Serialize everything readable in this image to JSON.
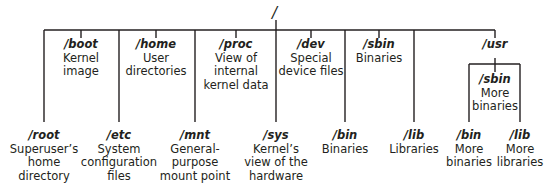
{
  "diagram": {
    "root": {
      "path": "/"
    },
    "top_nodes": [
      {
        "path": "/boot",
        "desc_lines": [
          "Kernel",
          "image"
        ]
      },
      {
        "path": "/home",
        "desc_lines": [
          "User",
          "directories"
        ]
      },
      {
        "path": "/proc",
        "desc_lines": [
          "View of",
          "internal",
          "kernel data"
        ]
      },
      {
        "path": "/dev",
        "desc_lines": [
          "Special",
          "device files"
        ]
      },
      {
        "path": "/sbin",
        "desc_lines": [
          "Binaries"
        ]
      },
      {
        "path": "/usr",
        "desc_lines": []
      }
    ],
    "bottom_nodes": [
      {
        "path": "/root",
        "desc_lines": [
          "Superuser’s",
          "home",
          "directory"
        ]
      },
      {
        "path": "/etc",
        "desc_lines": [
          "System",
          "configuration",
          "files"
        ]
      },
      {
        "path": "/mnt",
        "desc_lines": [
          "General-",
          "purpose",
          "mount point"
        ]
      },
      {
        "path": "/sys",
        "desc_lines": [
          "Kernel’s",
          "view of the",
          "hardware"
        ]
      },
      {
        "path": "/bin",
        "desc_lines": [
          "Binaries"
        ]
      },
      {
        "path": "/lib",
        "desc_lines": [
          "Libraries"
        ]
      }
    ],
    "usr_children": [
      {
        "path": "/sbin",
        "desc_lines": [
          "More",
          "binaries"
        ]
      },
      {
        "path": "/bin",
        "desc_lines": [
          "More",
          "binaries"
        ]
      },
      {
        "path": "/lib",
        "desc_lines": [
          "More",
          "libraries"
        ]
      }
    ],
    "line_color": "#231f20"
  }
}
